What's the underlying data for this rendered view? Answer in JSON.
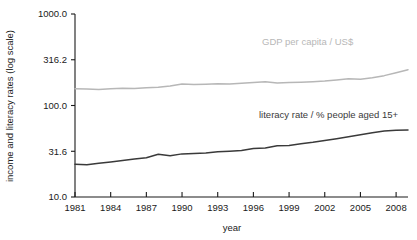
{
  "chart_data": {
    "type": "line",
    "title": "",
    "xlabel": "year",
    "ylabel": "income and literacy rates (log scale)",
    "log_y": true,
    "grid": false,
    "legend_position": "inline-annotation",
    "xlim": [
      1981,
      2009
    ],
    "ylim": [
      10.0,
      1000.0
    ],
    "ytick_labels": [
      "1000.0",
      "316.2",
      "100.0",
      "31.6",
      "10.0"
    ],
    "ytick_values": [
      1000.0,
      316.2,
      100.0,
      31.6,
      10.0
    ],
    "xtick_labels": [
      "1981",
      "1984",
      "1987",
      "1990",
      "1993",
      "1996",
      "1999",
      "2002",
      "2005",
      "2008"
    ],
    "xtick_values": [
      1981,
      1984,
      1987,
      1990,
      1993,
      1996,
      1999,
      2002,
      2005,
      2008
    ],
    "x": [
      1981,
      1982,
      1983,
      1984,
      1985,
      1986,
      1987,
      1988,
      1989,
      1990,
      1991,
      1992,
      1993,
      1994,
      1995,
      1996,
      1997,
      1998,
      1999,
      2000,
      2001,
      2002,
      2003,
      2004,
      2005,
      2006,
      2007,
      2008,
      2009
    ],
    "series": [
      {
        "name": "GDP per capita / US$",
        "color": "#b7b7b7",
        "label_color": "#b7b7b7",
        "values": [
          152,
          151,
          150,
          152,
          154,
          153,
          156,
          158,
          163,
          172,
          170,
          171,
          173,
          172,
          175,
          178,
          182,
          176,
          178,
          180,
          182,
          185,
          190,
          196,
          194,
          201,
          212,
          228,
          246
        ]
      },
      {
        "name": "literacy rate / % people aged 15+",
        "color": "#3a3a3a",
        "label_color": "#3a3a3a",
        "values": [
          22.8,
          22.5,
          23.4,
          24.2,
          25.1,
          26.0,
          26.9,
          29.3,
          28.3,
          29.6,
          29.9,
          30.3,
          31.2,
          31.6,
          32.2,
          33.8,
          34.3,
          36.4,
          36.6,
          38.1,
          39.6,
          41.5,
          43.4,
          45.6,
          48.0,
          50.5,
          52.5,
          53.6,
          54.0
        ]
      }
    ],
    "annotations": [
      {
        "text": "GDP per capita / US$",
        "x_px": 262,
        "y_px": 45,
        "color": "#b7b7b7"
      },
      {
        "text": "literacy rate / % people aged 15+",
        "x_px": 259,
        "y_px": 118,
        "color": "#3a3a3a"
      }
    ]
  }
}
